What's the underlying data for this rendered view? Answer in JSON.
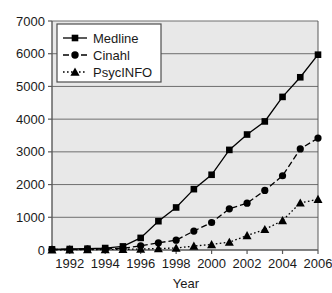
{
  "chart_data": {
    "type": "line",
    "title": "",
    "xlabel": "Year",
    "ylabel": "",
    "xlim": [
      1991,
      2006
    ],
    "ylim": [
      0,
      7000
    ],
    "grid": true,
    "legend_position": "top-left",
    "x": [
      1991,
      1992,
      1993,
      1994,
      1995,
      1996,
      1997,
      1998,
      1999,
      2000,
      2001,
      2002,
      2003,
      2004,
      2005,
      2006
    ],
    "xtick_labels": [
      "1992",
      "1994",
      "1996",
      "1998",
      "2000",
      "2002",
      "2004",
      "2006"
    ],
    "xticks": [
      1992,
      1994,
      1996,
      1998,
      2000,
      2002,
      2004,
      2006
    ],
    "ytick_labels": [
      "0",
      "1000",
      "2000",
      "3000",
      "4000",
      "5000",
      "6000",
      "7000"
    ],
    "yticks": [
      0,
      1000,
      2000,
      3000,
      4000,
      5000,
      6000,
      7000
    ],
    "series": [
      {
        "name": "Medline",
        "marker": "square",
        "line_style": "solid",
        "color": "#000000",
        "values": [
          20,
          30,
          40,
          60,
          110,
          370,
          880,
          1300,
          1860,
          2300,
          3060,
          3530,
          3930,
          4680,
          5280,
          5970
        ]
      },
      {
        "name": "Cinahl",
        "marker": "circle",
        "line_style": "dashed",
        "color": "#000000",
        "values": [
          15,
          20,
          25,
          35,
          50,
          130,
          220,
          300,
          580,
          840,
          1260,
          1430,
          1820,
          2270,
          3090,
          3420
        ]
      },
      {
        "name": "PsycINFO",
        "marker": "triangle",
        "line_style": "dotted",
        "color": "#000000",
        "values": [
          5,
          8,
          10,
          15,
          20,
          30,
          45,
          60,
          120,
          170,
          240,
          440,
          630,
          900,
          1440,
          1550
        ]
      }
    ]
  },
  "legend": {
    "items": [
      {
        "label": "Medline"
      },
      {
        "label": "Cinahl"
      },
      {
        "label": "PsycINFO"
      }
    ]
  },
  "axis": {
    "x_title": "Year"
  },
  "style": {
    "plot_background": "#e8e8e8",
    "grid_color": "#6e6e6e",
    "axis_color": "#5a5a5a",
    "series_color": "#000000",
    "page_background": "#ffffff"
  }
}
